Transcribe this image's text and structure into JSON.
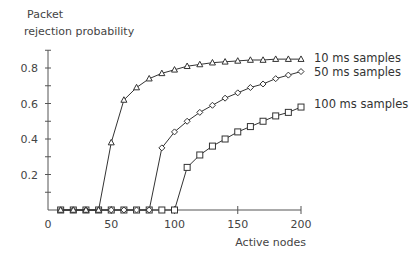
{
  "chart_data": {
    "type": "line",
    "title": "",
    "ylabel": "Packet rejection probability",
    "ylabel_lines": [
      "Packet",
      "rejection probability"
    ],
    "xlabel": "Active nodes",
    "xlim": [
      0,
      200
    ],
    "ylim": [
      0,
      0.9
    ],
    "xticks": [
      0,
      50,
      100,
      150,
      200
    ],
    "yticks": [
      0.2,
      0.4,
      0.6,
      0.8
    ],
    "ytick_labels": [
      "0.2",
      "0.4",
      "0.6",
      "0.8"
    ],
    "xtick_labels": [
      "0",
      "50",
      "100",
      "150",
      "200"
    ],
    "grid": false,
    "legend_position": "right, inline at series ends",
    "x": [
      10,
      20,
      30,
      40,
      50,
      60,
      70,
      80,
      90,
      100,
      110,
      120,
      130,
      140,
      150,
      160,
      170,
      180,
      190,
      200
    ],
    "series": [
      {
        "name": "10 ms samples",
        "marker": "triangle",
        "values": [
          0,
          0,
          0,
          0,
          0.38,
          0.62,
          0.69,
          0.74,
          0.77,
          0.79,
          0.81,
          0.82,
          0.83,
          0.835,
          0.84,
          0.845,
          0.845,
          0.85,
          0.85,
          0.85
        ]
      },
      {
        "name": "50 ms samples",
        "marker": "diamond",
        "values": [
          0,
          0,
          0,
          0,
          0,
          0,
          0,
          0,
          0.35,
          0.44,
          0.5,
          0.55,
          0.59,
          0.63,
          0.66,
          0.69,
          0.71,
          0.74,
          0.76,
          0.78
        ]
      },
      {
        "name": "100 ms samples",
        "marker": "square",
        "values": [
          0,
          0,
          0,
          0,
          0,
          0,
          0,
          0,
          0,
          0,
          0.24,
          0.31,
          0.36,
          0.4,
          0.44,
          0.47,
          0.5,
          0.53,
          0.55,
          0.58
        ]
      }
    ]
  },
  "colors": {
    "line": "#333333",
    "axis": "#555555",
    "text": "#444444"
  }
}
